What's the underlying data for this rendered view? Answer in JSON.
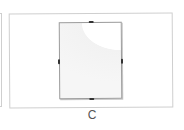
{
  "options": [
    {
      "label": "C",
      "image": "frameless-glass-clip-frame",
      "selected": false
    }
  ],
  "colors": {
    "card_border": "#cfcfcf",
    "frame_border": "#9a9a9a",
    "clip": "#333333",
    "label": "#555555"
  }
}
